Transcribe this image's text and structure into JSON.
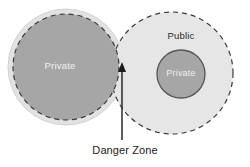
{
  "diagram": {
    "background_color": "#ffffff",
    "shapes": {
      "private_zone_outer": {
        "label": "",
        "fill_color": "#e2e2e2",
        "stroke_color": "#cfcfcf",
        "cx": 66,
        "cy": 67,
        "r": 58
      },
      "private_zone_core": {
        "label": "Private",
        "fill_color": "#a6a6a6",
        "stroke_color": "#3b3b3b",
        "stroke_style": "dashed",
        "text_color": "#f2f2f2",
        "cx": 66,
        "cy": 67,
        "r": 53
      },
      "public_zone": {
        "label": "Public",
        "fill_color": "#e6e6e6",
        "stroke_color": "#3b3b3b",
        "stroke_style": "dashed",
        "text_color": "#2b2b2b",
        "cx": 172,
        "cy": 73,
        "r": 61
      },
      "public_private_core": {
        "label": "Private",
        "fill_color": "#a6a6a6",
        "stroke_color": "#555555",
        "stroke_style": "solid",
        "text_color": "#efefef",
        "cx": 181,
        "cy": 74,
        "r": 24
      }
    },
    "annotation": {
      "label": "Danger Zone",
      "text_color": "#1c1c1c",
      "arrow_color": "#1c1c1c",
      "arrow_from_x": 122,
      "arrow_from_y": 140,
      "arrow_to_x": 122,
      "arrow_to_y": 63
    }
  }
}
